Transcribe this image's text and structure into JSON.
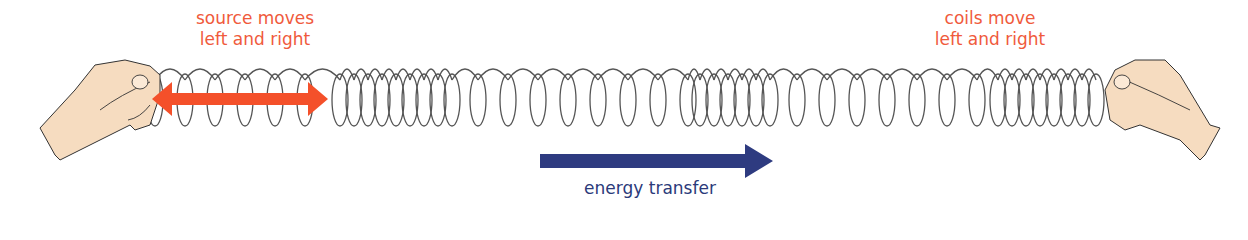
{
  "labels": {
    "source": [
      "source moves",
      "left and right"
    ],
    "coils": [
      "coils move",
      "left and right"
    ],
    "energy": "energy transfer"
  },
  "colors": {
    "source_arrow": "#f4502a",
    "label_orange": "#f05a3c",
    "energy_arrow": "#2e3b80",
    "coil_stroke": "#555555",
    "hand_fill": "#f6dcc0",
    "hand_stroke": "#333333"
  },
  "coils": {
    "segments": [
      {
        "start": 155,
        "end": 325,
        "spacing": 30
      },
      {
        "start": 340,
        "end": 460,
        "spacing": 14
      },
      {
        "start": 478,
        "end": 690,
        "spacing": 30
      },
      {
        "start": 700,
        "end": 780,
        "spacing": 14
      },
      {
        "start": 797,
        "end": 985,
        "spacing": 30
      },
      {
        "start": 998,
        "end": 1100,
        "spacing": 14
      }
    ]
  }
}
